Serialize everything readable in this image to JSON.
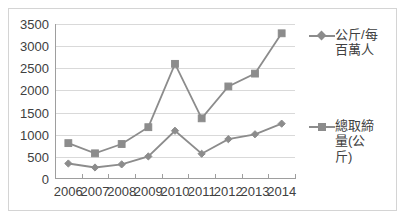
{
  "chart_data": {
    "type": "line",
    "title": "",
    "xlabel": "",
    "ylabel": "",
    "categories": [
      "2006",
      "2007",
      "2008",
      "2009",
      "2010",
      "2011",
      "2012",
      "2013",
      "2014"
    ],
    "ylim": [
      0,
      3500
    ],
    "ytick_values": [
      0,
      500,
      1000,
      1500,
      2000,
      2500,
      3000,
      3500
    ],
    "ytick_labels": [
      "0",
      "500",
      "1000",
      "1500",
      "2000",
      "2500",
      "3000",
      "3500"
    ],
    "grid": true,
    "legend_position": "right",
    "series": [
      {
        "name": "公斤/每百萬人",
        "marker": "diamond",
        "color": "#8c8c8c",
        "values": [
          350,
          260,
          330,
          510,
          1090,
          570,
          900,
          1010,
          1250
        ]
      },
      {
        "name": "總取締量(公斤)",
        "marker": "square",
        "color": "#8c8c8c",
        "values": [
          810,
          580,
          790,
          1170,
          2600,
          1370,
          2090,
          2380,
          3290
        ]
      }
    ]
  },
  "legend": {
    "items": [
      {
        "label": "公斤/每百萬人",
        "marker": "diamond"
      },
      {
        "label": "總取締量(公斤)",
        "marker": "square"
      }
    ]
  },
  "colors": {
    "series": "#8c8c8c",
    "gridline": "#d9d9d9",
    "axis": "#9e9e9e",
    "text": "#404040",
    "frame_border": "#d4d4d4",
    "background": "#ffffff"
  }
}
